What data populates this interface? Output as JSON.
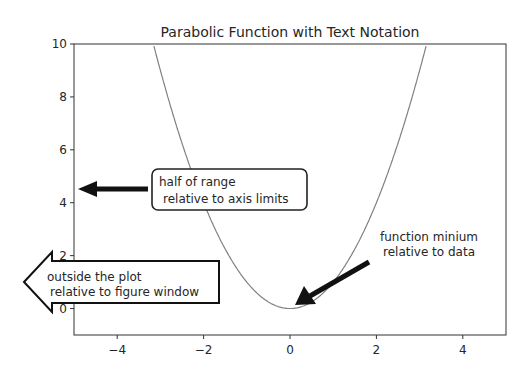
{
  "chart_data": {
    "type": "line",
    "title": "Parabolic Function with Text Notation",
    "xlabel": "",
    "ylabel": "",
    "xlim": [
      -5,
      5
    ],
    "ylim": [
      -1,
      10
    ],
    "xticks": [
      -4,
      -2,
      0,
      2,
      4
    ],
    "xtick_labels": [
      "−4",
      "−2",
      "0",
      "2",
      "4"
    ],
    "yticks": [
      0,
      2,
      4,
      6,
      8,
      10
    ],
    "ytick_labels": [
      "0",
      "2",
      "4",
      "6",
      "8",
      "10"
    ],
    "grid": false,
    "series": [
      {
        "name": "y = x^2",
        "function": "x^2",
        "color": "#808080",
        "x": [
          -3.2,
          -3,
          -2.5,
          -2,
          -1.5,
          -1,
          -0.5,
          0,
          0.5,
          1,
          1.5,
          2,
          2.5,
          3,
          3.2
        ],
        "y": [
          10.24,
          9,
          6.25,
          4,
          2.25,
          1,
          0.25,
          0,
          0.25,
          1,
          2.25,
          4,
          6.25,
          9,
          10.24
        ]
      }
    ],
    "annotations": [
      {
        "id": "minimum",
        "text_lines": [
          "function minium",
          "relative to data"
        ],
        "xy": [
          0,
          0
        ],
        "xycoords": "data",
        "style": "simple-arrow"
      },
      {
        "id": "half-range",
        "text_lines": [
          "half of range",
          " relative to axis limits"
        ],
        "xy": [
          0,
          0.5
        ],
        "xycoords": "axes fraction",
        "style": "round-box-arrow"
      },
      {
        "id": "outside",
        "text_lines": [
          "outside the plot",
          " relative to figure window"
        ],
        "xycoords": "figure fraction",
        "style": "larrow-box"
      }
    ]
  }
}
